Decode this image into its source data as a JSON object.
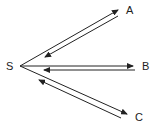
{
  "diagram": {
    "source_node": {
      "label": "S",
      "x": 6,
      "y": 61
    },
    "target_nodes": [
      {
        "label": "A",
        "x": 126,
        "y": 5
      },
      {
        "label": "B",
        "x": 142,
        "y": 61
      },
      {
        "label": "C",
        "x": 135,
        "y": 112
      }
    ],
    "edges": [
      {
        "from": "S",
        "to": "A",
        "direction": "outgoing"
      },
      {
        "from": "A",
        "to": "S",
        "direction": "return"
      },
      {
        "from": "S",
        "to": "B",
        "direction": "outgoing"
      },
      {
        "from": "B",
        "to": "S",
        "direction": "return"
      },
      {
        "from": "S",
        "to": "C",
        "direction": "outgoing"
      },
      {
        "from": "C",
        "to": "S",
        "direction": "return"
      }
    ],
    "line_color": "#222222"
  }
}
